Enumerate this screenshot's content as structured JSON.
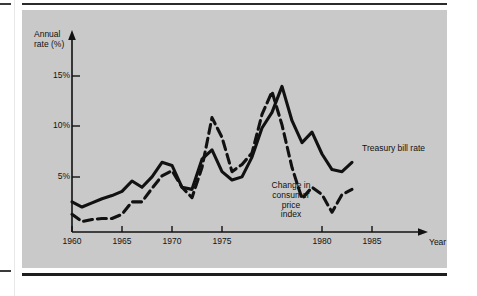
{
  "figure": {
    "panel_background": "#c9c9c9",
    "ink_color": "#111111"
  },
  "axes": {
    "y_title_line1": "Annual",
    "y_title_line2": "rate (%)",
    "x_title": "Year",
    "y_ticks": [
      "5%",
      "10%",
      "15%"
    ],
    "x_ticks": [
      "1960",
      "1965",
      "1970",
      "1975",
      "1980",
      "1985"
    ]
  },
  "labels": {
    "treasury": "Treasury bill rate",
    "cpi_line1": "Change in",
    "cpi_line2": "consumer",
    "cpi_line3": "price",
    "cpi_line4": "index"
  },
  "chart_data": {
    "type": "line",
    "title": "",
    "xlabel": "Year",
    "ylabel": "Annual rate (%)",
    "xlim": [
      1960,
      1988
    ],
    "ylim": [
      0,
      16
    ],
    "ytick_values": [
      5,
      10,
      15
    ],
    "xtick_values": [
      1960,
      1965,
      1970,
      1975,
      1980,
      1985
    ],
    "grid": false,
    "legend": "inline-annotations",
    "x": [
      1960,
      1961,
      1962,
      1963,
      1964,
      1965,
      1966,
      1967,
      1968,
      1969,
      1970,
      1971,
      1972,
      1973,
      1974,
      1975,
      1976,
      1977,
      1978,
      1979,
      1980,
      1981,
      1982,
      1983,
      1984,
      1985,
      1986,
      1987,
      1988
    ],
    "series": [
      {
        "name": "Treasury bill rate",
        "style": "solid",
        "values": [
          2.9,
          2.4,
          2.8,
          3.2,
          3.5,
          3.9,
          4.9,
          4.3,
          5.3,
          6.7,
          6.4,
          4.3,
          4.1,
          7.0,
          7.9,
          5.8,
          5.0,
          5.3,
          7.2,
          10.0,
          11.5,
          14.0,
          10.7,
          8.6,
          9.6,
          7.5,
          6.0,
          5.8,
          6.7
        ]
      },
      {
        "name": "Change in consumer price index",
        "style": "dashed",
        "values": [
          1.7,
          1.0,
          1.2,
          1.3,
          1.3,
          1.7,
          2.9,
          2.9,
          4.2,
          5.4,
          5.9,
          4.3,
          3.3,
          6.2,
          11.0,
          9.1,
          5.8,
          6.5,
          7.6,
          11.3,
          13.5,
          10.3,
          6.2,
          3.2,
          4.3,
          3.6,
          1.9,
          3.6,
          4.1
        ]
      }
    ]
  }
}
